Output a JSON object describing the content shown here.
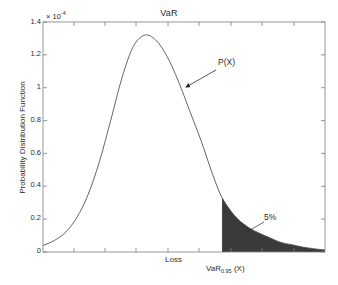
{
  "chart_data": {
    "type": "area",
    "title": "VaR",
    "xlabel": "",
    "ylabel": "Probability Distribution Function",
    "y_exponent_label": "× 10",
    "y_exponent_value": "-4",
    "yticks": [
      "0",
      "0.2",
      "0.4",
      "0.6",
      "0.8",
      "1",
      "1.2",
      "1.4"
    ],
    "ytick_values": [
      0,
      0.2,
      0.4,
      0.6,
      0.8,
      1.0,
      1.2,
      1.4
    ],
    "ylim": [
      0,
      1.4
    ],
    "xticks": [],
    "xtick_labels": [],
    "grid": false,
    "legend": false,
    "x_axis_annotations": [
      {
        "label": "Loss",
        "x_frac": 0.48
      },
      {
        "label_prefix": "VaR",
        "label_subscript": "0.95",
        "label_suffix": " (X)",
        "x_frac": 0.635
      }
    ],
    "annotations": [
      {
        "text": "P(X)",
        "x_frac": 0.565,
        "y_value": 1.12,
        "kind": "arrow-to-curve"
      },
      {
        "text": "5%",
        "x_frac": 0.775,
        "y_value": 0.27,
        "kind": "leader-to-shaded-tail"
      }
    ],
    "shaded_region": {
      "label": "5%",
      "start_x_frac": 0.635,
      "end_x_frac": 1.0,
      "fill_color": "#3a3a3a",
      "area_fraction": 0.05
    },
    "curve_color": "#555555",
    "series": [
      {
        "name": "P(X)",
        "x": [
          0.0,
          0.04,
          0.08,
          0.12,
          0.16,
          0.2,
          0.24,
          0.28,
          0.32,
          0.36,
          0.4,
          0.44,
          0.48,
          0.52,
          0.56,
          0.6,
          0.635,
          0.68,
          0.72,
          0.76,
          0.8,
          0.84,
          0.88,
          0.92,
          0.96,
          1.0
        ],
        "y": [
          0.04,
          0.07,
          0.12,
          0.21,
          0.35,
          0.55,
          0.8,
          1.06,
          1.25,
          1.32,
          1.29,
          1.19,
          1.04,
          0.86,
          0.68,
          0.48,
          0.33,
          0.22,
          0.16,
          0.12,
          0.09,
          0.06,
          0.045,
          0.03,
          0.02,
          0.012
        ]
      }
    ]
  },
  "figure": {
    "title": "VaR",
    "exponent_prefix": "× 10",
    "exponent_power": "-4",
    "ylabel": "Probability Distribution Function",
    "loss_label": "Loss",
    "var_prefix": "VaR",
    "var_subscript": "0.95",
    "var_suffix": " (X)",
    "pdf_annotation": "P(X)",
    "percent_annotation": "5%"
  }
}
